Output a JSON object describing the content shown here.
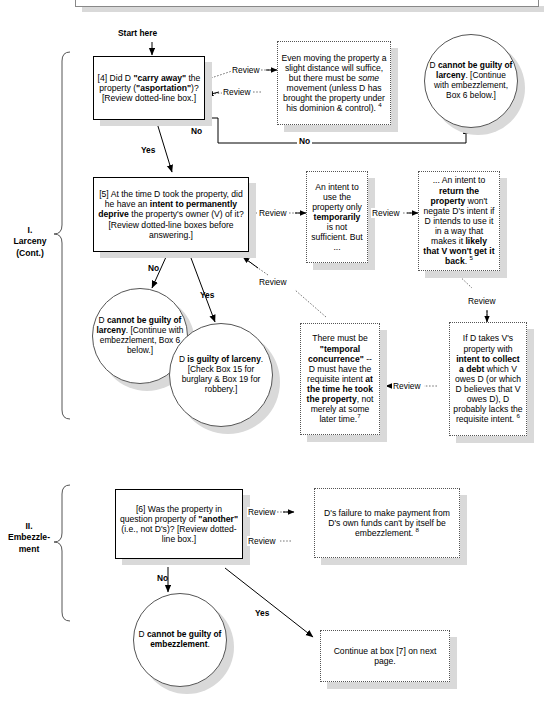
{
  "page": {
    "width": 552,
    "height": 704,
    "background": "#ffffff",
    "line_color": "#000000",
    "shadow_color": "#d9d9d9"
  },
  "sections": [
    {
      "id": "larceny",
      "label": "I.\nLarceny\n(Cont.)"
    },
    {
      "id": "embezzlement",
      "label": "II.\nEmbezzle-\nment"
    }
  ],
  "nodes": {
    "start_label": "Start here",
    "box4": {
      "id": "4",
      "shape": "process",
      "text_html": "[4] Did D <b>\"carry away\"</b> the property (<b>\"asportation\"</b>)? [Review dotted-line box.]",
      "text_plain": "[4] Did D \"carry away\" the property (\"asportation\")? [Review dotted-line box.]"
    },
    "note4": {
      "shape": "note",
      "footnote": "4",
      "text_html": "Even moving the property a slight distance will suffice, but there must be <i>some</i> movement (unless D has brought the property under his dominion &amp; control). <sup>4</sup>",
      "text_plain": "Even moving the property a slight distance will suffice, but there must be some movement (unless D has brought the property under his dominion & control). 4"
    },
    "circle_no_larceny_top": {
      "shape": "terminator",
      "text_html": "D <b>cannot be guilty of larceny</b>. [Continue with embezzlement, Box 6 below.]",
      "text_plain": "D cannot be guilty of larceny. [Continue with embezzlement, Box 6 below.]"
    },
    "box5": {
      "id": "5",
      "shape": "process",
      "text_html": "[5] At the time D took the property, did he have an <b>intent to permanently deprive</b> the property's owner (V) of it? [Review dotted-line boxes before answering.]",
      "text_plain": "[5] At the time D took the property, did he have an intent to permanently deprive the property's owner (V) of it? [Review dotted-line boxes before answering.]"
    },
    "note_temporary": {
      "shape": "note",
      "text_html": "An intent to use the property only <b>temporarily</b> is not sufficient. But ...",
      "text_plain": "An intent to use the property only temporarily is not sufficient. But ..."
    },
    "note_return": {
      "shape": "note",
      "footnote": "5",
      "text_html": "... An intent to <b>return the property</b> won't negate D's intent if D intends to use it in a way that makes it <b>likely that V won't get it back</b>. <sup>5</sup>",
      "text_plain": "... An intent to return the property won't negate D's intent if D intends to use it in a way that makes it likely that V won't get it back. 5"
    },
    "circle_no_larceny_bottom": {
      "shape": "terminator",
      "text_html": "D <b>cannot be guilty of larceny</b>. [Continue with embezzlement, Box 6 below.]",
      "text_plain": "D cannot be guilty of larceny. [Continue with embezzlement, Box 6 below.]"
    },
    "circle_guilty_larceny": {
      "shape": "terminator",
      "text_html": "D <b>is guilty of larceny</b>. [Check Box 15 for burglary &amp; Box 19 for robbery.]",
      "text_plain": "D is guilty of larceny. [Check Box 15 for burglary & Box 19 for robbery.]"
    },
    "note_temporal": {
      "shape": "note",
      "footnote": "7",
      "text_html": "There must be <b>\"temporal concurrence\"</b> -- D must have the requisite intent <b>at the time he took the property</b>, not merely at some later time.<sup>7</sup>",
      "text_plain": "There must be \"temporal concurrence\" -- D must have the requisite intent at the time he took the property, not merely at some later time.7"
    },
    "note_debt": {
      "shape": "note",
      "footnote": "6",
      "text_html": "If D takes V's property with <b>intent to collect a debt</b> which V owes D (or which D believes that V owes D), D probably lacks the requisite intent. <sup>6</sup>",
      "text_plain": "If D takes V's property with intent to collect a debt which V owes D (or which D believes that V owes D), D probably lacks the requisite intent. 6"
    },
    "box6": {
      "id": "6",
      "shape": "process",
      "text_html": "[6] Was the property in question property of <b>\"another\"</b> (i.e., not D's)? [Review dotted-line box.]",
      "text_plain": "[6] Was the property in question property of \"another\" (i.e., not D's)? [Review dotted-line box.]"
    },
    "note_payment": {
      "shape": "note",
      "footnote": "8",
      "text_html": "D's failure to make payment from D's own funds can't by itself be embezzlement. <sup>8</sup>",
      "text_plain": "D's failure to make payment from D's own funds can't by itself be embezzlement. 8"
    },
    "circle_no_embezzlement": {
      "shape": "terminator",
      "text_html": "D <b>cannot be guilty of embezzlement</b>.",
      "text_plain": "D cannot be guilty of embezzlement."
    },
    "note_continue": {
      "shape": "note",
      "text_html": "Continue at box [7] on next page.",
      "text_plain": "Continue at box [7] on next page."
    }
  },
  "edges": [
    {
      "id": "start-to-box4",
      "label": "",
      "from": "start_label",
      "to": "box4"
    },
    {
      "id": "box4-review-out",
      "label": "Review",
      "from": "box4",
      "to": "note4"
    },
    {
      "id": "box4-review-in",
      "label": "Review",
      "from": "note4",
      "to": "box4"
    },
    {
      "id": "box4-no-stub",
      "label": "No",
      "from": "box4",
      "to": "circle_no_larceny_top"
    },
    {
      "id": "box4-no-long",
      "label": "No",
      "from": "box4",
      "to": "circle_no_larceny_top"
    },
    {
      "id": "box4-yes",
      "label": "Yes",
      "from": "box4",
      "to": "box5"
    },
    {
      "id": "box5-review-temp",
      "label": "Review",
      "from": "box5",
      "to": "note_temporary"
    },
    {
      "id": "temp-review-return",
      "label": "Review",
      "from": "note_temporary",
      "to": "note_return"
    },
    {
      "id": "return-review-debt",
      "label": "Review",
      "from": "note_return",
      "to": "note_debt"
    },
    {
      "id": "debt-review-temporal",
      "label": "Review",
      "from": "note_debt",
      "to": "note_temporal"
    },
    {
      "id": "temporal-review-box5",
      "label": "Review",
      "from": "note_temporal",
      "to": "box5"
    },
    {
      "id": "box5-no",
      "label": "No",
      "from": "box5",
      "to": "circle_no_larceny_bottom"
    },
    {
      "id": "box5-yes",
      "label": "Yes",
      "from": "box5",
      "to": "circle_guilty_larceny"
    },
    {
      "id": "box6-review-out",
      "label": "Review",
      "from": "box6",
      "to": "note_payment"
    },
    {
      "id": "box6-review-in",
      "label": "Review",
      "from": "note_payment",
      "to": "box6"
    },
    {
      "id": "box6-no",
      "label": "No",
      "from": "box6",
      "to": "circle_no_embezzlement"
    },
    {
      "id": "box6-yes",
      "label": "Yes",
      "from": "box6",
      "to": "note_continue"
    }
  ],
  "wire_labels": {
    "start_here": "Start here",
    "review": "Review",
    "yes": "Yes",
    "no": "No"
  }
}
